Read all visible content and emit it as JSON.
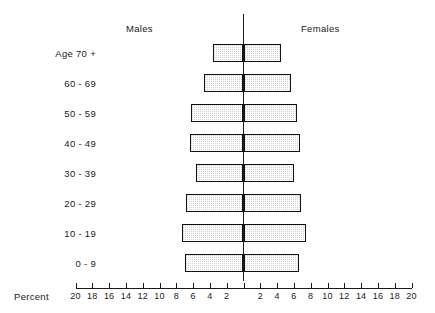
{
  "chart_data": {
    "type": "bar",
    "subtype": "population-pyramid",
    "title": "",
    "xlabel": "Percent",
    "ylabel": "",
    "categories": [
      "Age 70 +",
      "60 - 69",
      "50 - 59",
      "40 - 49",
      "30 - 39",
      "20 - 29",
      "10 - 19",
      "0 - 9"
    ],
    "series": [
      {
        "name": "Males",
        "side": "left",
        "values": [
          3.6,
          4.7,
          6.3,
          6.4,
          5.7,
          6.9,
          7.3,
          7.0
        ]
      },
      {
        "name": "Females",
        "side": "right",
        "values": [
          4.5,
          5.6,
          6.4,
          6.7,
          6.0,
          6.9,
          7.4,
          6.6
        ]
      }
    ],
    "xlim": [
      -20,
      20
    ],
    "x_max_percent": 20,
    "xticks": [
      20,
      18,
      16,
      14,
      12,
      10,
      8,
      6,
      4,
      2,
      0,
      2,
      4,
      6,
      8,
      10,
      12,
      14,
      16,
      18,
      20
    ],
    "xtick_labels_left": [
      "20",
      "18",
      "16",
      "14",
      "12",
      "10",
      "8",
      "6",
      "4",
      "2"
    ],
    "xtick_labels_right": [
      "2",
      "4",
      "6",
      "8",
      "10",
      "12",
      "14",
      "16",
      "18",
      "20"
    ],
    "grid": false,
    "legend_position": "top-inline",
    "bar_fill_color": "#d2d2d2",
    "bar_border_color": "#111111",
    "axis_color": "#1a1a1a"
  },
  "header": {
    "males_label": "Males",
    "females_label": "Females"
  },
  "axis": {
    "percent_label": "Percent"
  }
}
